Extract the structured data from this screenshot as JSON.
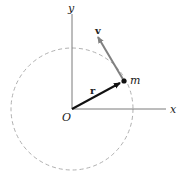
{
  "diagram": {
    "origin_label": "O",
    "x_axis_label": "x",
    "y_axis_label": "y",
    "particle_label": "m",
    "position_vector_label": "r",
    "velocity_vector_label": "v",
    "colors": {
      "axes": "#7a7a7a",
      "circle": "#b0b0b0",
      "position_vector": "#111111",
      "velocity_vector": "#808080",
      "particle": "#111111"
    }
  }
}
